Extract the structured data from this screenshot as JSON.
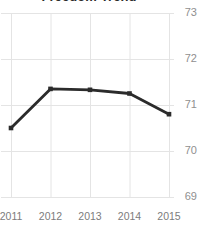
{
  "chart_data": {
    "type": "line",
    "title": "Freedom Trend",
    "xlabel": "",
    "ylabel": "",
    "categories": [
      "2011",
      "2012",
      "2013",
      "2014",
      "2015"
    ],
    "x": [
      2011,
      2012,
      2013,
      2014,
      2015
    ],
    "series": [
      {
        "name": "Freedom Trend",
        "values": [
          70.5,
          71.35,
          71.33,
          71.25,
          70.8
        ],
        "color": "#2b2b2b",
        "marker": "square"
      }
    ],
    "ytick_labels": [
      "73",
      "72",
      "71",
      "70",
      "69"
    ],
    "ytick_values": [
      73,
      72,
      71,
      70,
      69
    ],
    "xtick_labels": [
      "2011",
      "2012",
      "2013",
      "2014",
      "2015"
    ],
    "ylim": [
      69,
      73
    ],
    "xlim": [
      2011,
      2015
    ],
    "grid": true,
    "grid_color": "#e4e4e4",
    "y_axis_position": "right",
    "legend": false,
    "legend_position": "none",
    "background": "#ffffff",
    "tick_label_color": "#8f8f8f"
  }
}
